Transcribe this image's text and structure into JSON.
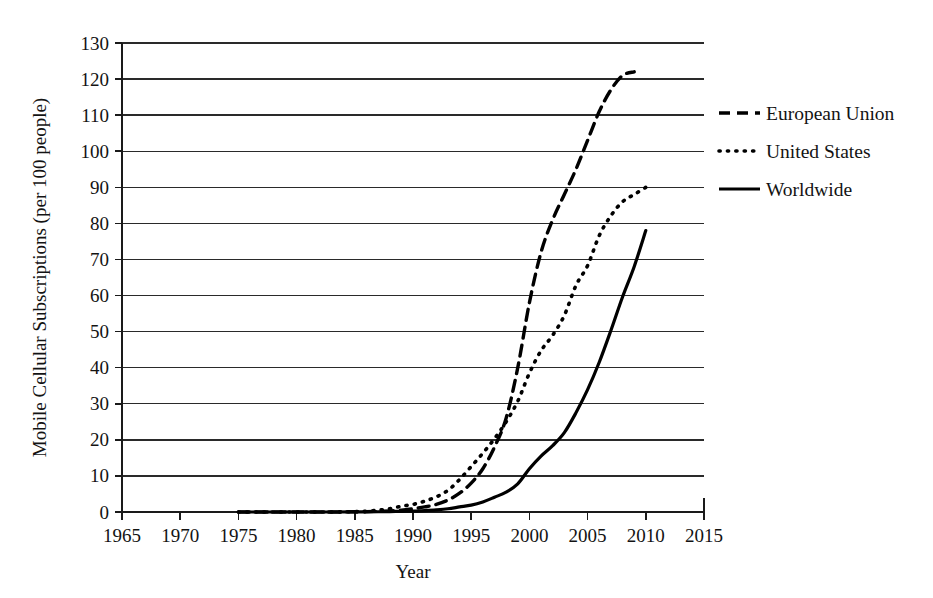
{
  "chart_data": {
    "type": "line",
    "title": "",
    "xlabel": "Year",
    "ylabel": "Mobile Cellular Subscriptions (per 100 people)",
    "xlim": [
      1965,
      2015
    ],
    "ylim": [
      0,
      130
    ],
    "xticks": [
      1965,
      1970,
      1975,
      1980,
      1985,
      1990,
      1995,
      2000,
      2005,
      2010,
      2015
    ],
    "yticks": [
      0,
      10,
      20,
      30,
      40,
      50,
      60,
      70,
      80,
      90,
      100,
      110,
      120,
      130
    ],
    "xtick_labels": [
      "1965",
      "1970",
      "1975",
      "1980",
      "1985",
      "1990",
      "1995",
      "2000",
      "2005",
      "2010",
      "2015"
    ],
    "ytick_labels": [
      "0",
      "10",
      "20",
      "30",
      "40",
      "50",
      "60",
      "70",
      "80",
      "90",
      "100",
      "110",
      "120",
      "130"
    ],
    "grid": "horizontal",
    "legend_position": "right",
    "series": [
      {
        "name": "European Union",
        "style": "dashed",
        "color": "#000000",
        "x": [
          1975,
          1980,
          1983,
          1985,
          1986,
          1987,
          1988,
          1989,
          1990,
          1991,
          1992,
          1993,
          1994,
          1995,
          1996,
          1997,
          1998,
          1999,
          2000,
          2001,
          2002,
          2003,
          2004,
          2005,
          2006,
          2007,
          2008,
          2009
        ],
        "values": [
          0,
          0,
          0,
          0.05,
          0.1,
          0.2,
          0.3,
          0.5,
          0.9,
          1.4,
          2.1,
          3.3,
          5.2,
          8.0,
          12.0,
          18.0,
          26.0,
          40.0,
          58.0,
          72.0,
          81.0,
          88.0,
          95.0,
          103.0,
          111.0,
          117.0,
          121.0,
          122.0
        ]
      },
      {
        "name": "United States",
        "style": "dotted",
        "color": "#000000",
        "x": [
          1975,
          1980,
          1983,
          1985,
          1986,
          1987,
          1988,
          1989,
          1990,
          1991,
          1992,
          1993,
          1994,
          1995,
          1996,
          1997,
          1998,
          1999,
          2000,
          2001,
          2002,
          2003,
          2004,
          2005,
          2006,
          2007,
          2008,
          2009,
          2010
        ],
        "values": [
          0,
          0,
          0,
          0.1,
          0.2,
          0.5,
          0.9,
          1.6,
          2.1,
          3.0,
          4.2,
          6.0,
          9.0,
          12.6,
          16.3,
          20.3,
          25.0,
          30.7,
          38.5,
          44.7,
          49.0,
          54.5,
          62.8,
          68.3,
          76.6,
          82.1,
          86.0,
          88.0,
          90.0
        ]
      },
      {
        "name": "Worldwide",
        "style": "solid",
        "color": "#000000",
        "x": [
          1975,
          1980,
          1983,
          1985,
          1986,
          1987,
          1988,
          1989,
          1990,
          1991,
          1992,
          1993,
          1994,
          1995,
          1996,
          1997,
          1998,
          1999,
          2000,
          2001,
          2002,
          2003,
          2004,
          2005,
          2006,
          2007,
          2008,
          2009,
          2010
        ],
        "values": [
          0,
          0,
          0,
          0.02,
          0.04,
          0.07,
          0.12,
          0.2,
          0.25,
          0.4,
          0.6,
          0.9,
          1.4,
          1.9,
          2.8,
          4.1,
          5.5,
          7.8,
          12.0,
          15.5,
          18.4,
          22.0,
          27.5,
          33.9,
          41.5,
          50.3,
          59.6,
          68.0,
          78.0
        ]
      }
    ]
  },
  "legend": {
    "items": [
      {
        "label": "European Union",
        "style": "dashed"
      },
      {
        "label": "United States",
        "style": "dotted"
      },
      {
        "label": "Worldwide",
        "style": "solid"
      }
    ]
  }
}
